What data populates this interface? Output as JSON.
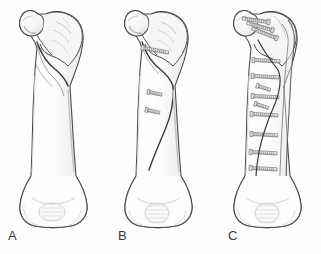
{
  "figure": {
    "background_color": "#fdfdfd",
    "ink_color": "#4a4a4a",
    "bone_fill": "#fcfcfc",
    "shade_color": "#d8d8d8",
    "metal_color": "#6a6a6a",
    "width": 321,
    "height": 254
  },
  "panels": [
    {
      "id": "A",
      "label": "A",
      "label_x": 8,
      "label_y": 240,
      "caption": "Oblique spiral fracture of the proximal femoral shaft, unfixed",
      "origin_x": 8,
      "anatomy": {
        "head": "femoral-head",
        "neck": "femoral-neck",
        "greater_trochanter": "greater-trochanter",
        "lesser_trochanter": "lesser-trochanter",
        "shaft": "femoral-shaft",
        "condyles": "distal-femoral-condyles"
      },
      "hardware": [],
      "fracture": {
        "type": "oblique-spiral",
        "visible": true
      }
    },
    {
      "id": "B",
      "label": "B",
      "label_x": 118,
      "label_y": 240,
      "caption": "Same fracture reduced and held with three interfragmentary lag screws",
      "origin_x": 113,
      "anatomy": {
        "head": "femoral-head",
        "neck": "femoral-neck",
        "greater_trochanter": "greater-trochanter",
        "lesser_trochanter": "lesser-trochanter",
        "shaft": "femoral-shaft",
        "condyles": "distal-femoral-condyles"
      },
      "hardware": [
        {
          "type": "lag-screw",
          "index": 1,
          "y": 48
        },
        {
          "type": "lag-screw",
          "index": 2,
          "y": 92
        },
        {
          "type": "lag-screw",
          "index": 3,
          "y": 110
        }
      ],
      "fracture": {
        "type": "oblique-spiral",
        "visible": true
      }
    },
    {
      "id": "C",
      "label": "C",
      "label_x": 228,
      "label_y": 240,
      "caption": "Fracture stabilised with a lateral compression plate, proximal neck screws and cortical screws",
      "origin_x": 222,
      "anatomy": {
        "head": "femoral-head",
        "neck": "femoral-neck",
        "greater_trochanter": "greater-trochanter",
        "lesser_trochanter": "lesser-trochanter",
        "shaft": "femoral-shaft",
        "condyles": "distal-femoral-condyles"
      },
      "hardware": [
        {
          "type": "neck-screw",
          "index": 1
        },
        {
          "type": "neck-screw",
          "index": 2
        },
        {
          "type": "neck-screw",
          "index": 3
        },
        {
          "type": "lateral-plate",
          "index": 1
        },
        {
          "type": "cortical-screw",
          "index": 1,
          "y": 60
        },
        {
          "type": "cortical-screw",
          "index": 2,
          "y": 76
        },
        {
          "type": "cortical-screw",
          "index": 3,
          "y": 96
        },
        {
          "type": "cortical-screw",
          "index": 4,
          "y": 114
        },
        {
          "type": "cortical-screw",
          "index": 5,
          "y": 134
        },
        {
          "type": "cortical-screw",
          "index": 6,
          "y": 152
        },
        {
          "type": "cortical-screw",
          "index": 7,
          "y": 168
        },
        {
          "type": "lag-screw",
          "index": 1,
          "y": 86
        },
        {
          "type": "lag-screw",
          "index": 2,
          "y": 104
        }
      ],
      "fracture": {
        "type": "oblique-spiral",
        "visible": true
      }
    }
  ]
}
